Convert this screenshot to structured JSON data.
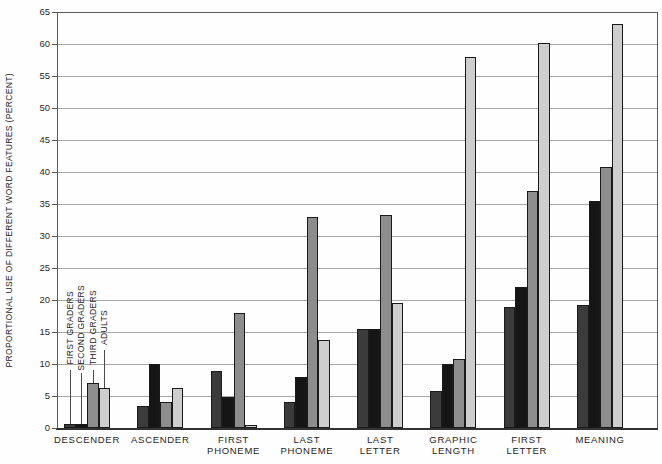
{
  "figure": {
    "y_axis_title": "PROPORTIONAL USE OF DIFFERENT WORD FEATURES (PERCENT)"
  },
  "chart_data": {
    "type": "bar",
    "title": "",
    "xlabel": "",
    "ylabel": "PROPORTIONAL USE OF DIFFERENT WORD FEATURES (PERCENT)",
    "ylim": [
      0,
      65
    ],
    "ytick_step": 5,
    "grid": true,
    "legend_position": "inside-top-of-first-group-rotated-labels-with-leader-lines",
    "categories": [
      "DESCENDER",
      "ASCENDER",
      "FIRST\nPHONEME",
      "LAST\nPHONEME",
      "LAST\nLETTER",
      "GRAPHIC\nLENGTH",
      "FIRST\nLETTER",
      "MEANING"
    ],
    "series": [
      {
        "name": "FIRST GRADERS",
        "color": "#3b3b3b",
        "values": [
          0.6,
          3.5,
          8.9,
          4.0,
          15.5,
          5.8,
          18.9,
          19.2
        ]
      },
      {
        "name": "SECOND GRADERS",
        "color": "#151515",
        "values": [
          0.6,
          10.0,
          4.9,
          8.0,
          15.5,
          10.0,
          22.0,
          35.5
        ]
      },
      {
        "name": "THIRD GRADERS",
        "color": "#8d8d8d",
        "values": [
          7.0,
          4.0,
          18.0,
          33.0,
          33.3,
          10.8,
          37.0,
          40.8
        ]
      },
      {
        "name": "ADULTS",
        "color": "#cecece",
        "values": [
          6.3,
          6.2,
          0.5,
          13.8,
          19.5,
          58.0,
          60.2,
          63.2
        ]
      }
    ]
  }
}
